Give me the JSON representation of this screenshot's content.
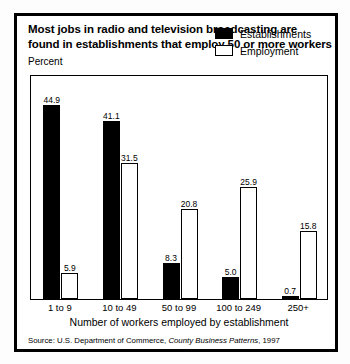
{
  "title": {
    "line1": "Most jobs in radio and television broadcasting are",
    "line2": "found in establishments that employ 50 or more workers"
  },
  "axis": {
    "y_label": "Percent",
    "x_title": "Number of workers employed by establishment"
  },
  "legend": {
    "items": [
      {
        "label": "Establishments",
        "swatch": "filled-black"
      },
      {
        "label": "Employment",
        "swatch": "hollow-white"
      }
    ]
  },
  "source": {
    "prefix": "Source: U.S. Department of Commerce, ",
    "publication": "County Business Patterns",
    "suffix": ", 1997"
  },
  "chart_data": {
    "type": "bar",
    "title": "Most jobs in radio and television broadcasting are found in establishments that employ 50 or more workers",
    "xlabel": "Number of workers employed by establishment",
    "ylabel": "Percent",
    "ylim": [
      0,
      52
    ],
    "grid": false,
    "legend_position": "top-right",
    "categories": [
      "1 to 9",
      "10 to 49",
      "50 to 99",
      "100 to 249",
      "250+"
    ],
    "series": [
      {
        "name": "Establishments",
        "color": "#000000",
        "style": "filled",
        "values": [
          44.9,
          41.1,
          8.3,
          5.0,
          0.7
        ]
      },
      {
        "name": "Employment",
        "color": "#ffffff",
        "style": "outlined",
        "values": [
          5.9,
          31.5,
          20.8,
          25.9,
          15.8
        ]
      }
    ],
    "value_labels": {
      "Establishments": [
        "44.9",
        "41.1",
        "8.3",
        "5.0",
        "0.7"
      ],
      "Employment": [
        "5.9",
        "31.5",
        "20.8",
        "25.9",
        "15.8"
      ]
    },
    "source": "Source: U.S. Department of Commerce, County Business Patterns, 1997"
  }
}
